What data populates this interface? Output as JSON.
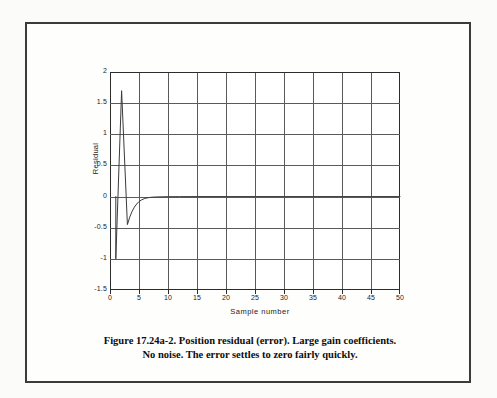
{
  "figure": {
    "caption_line1": "Figure 17.24a-2. Position residual (error). Large gain coefficients.",
    "caption_line2": "No noise. The error settles to zero fairly quickly."
  },
  "chart_data": {
    "type": "line",
    "title": "",
    "xlabel": "Sample number",
    "ylabel": "Residual",
    "xlim": [
      0,
      50
    ],
    "ylim": [
      -1.5,
      2
    ],
    "xticks": [
      0,
      5,
      10,
      15,
      20,
      25,
      30,
      35,
      40,
      45,
      50
    ],
    "xtick_labels": [
      "0",
      "5",
      "10",
      "15",
      "20",
      "25",
      "30",
      "35",
      "40",
      "45",
      "50"
    ],
    "yticks": [
      2,
      1.5,
      1,
      0.5,
      0,
      -0.5,
      -1,
      -1.5
    ],
    "ytick_labels": [
      "2",
      "1.5",
      "1",
      "0.5",
      "0",
      "-0.5",
      "-1",
      "-1.5"
    ],
    "grid": true,
    "legend": null,
    "line_color": "#3a3a3a",
    "series": [
      {
        "name": "Position residual",
        "x": [
          1,
          1,
          2,
          3,
          3.4,
          3.8,
          4.2,
          4.6,
          5.0,
          5.5,
          6.0,
          6.5,
          7,
          8,
          10,
          12,
          15,
          20,
          25,
          30,
          35,
          40,
          45,
          50
        ],
        "values": [
          0,
          -1.0,
          1.7,
          -0.45,
          -0.33,
          -0.24,
          -0.17,
          -0.12,
          -0.08,
          -0.05,
          -0.03,
          -0.02,
          -0.012,
          -0.006,
          -0.002,
          -0.001,
          0,
          0,
          0,
          0,
          0,
          0,
          0,
          0
        ]
      }
    ]
  }
}
